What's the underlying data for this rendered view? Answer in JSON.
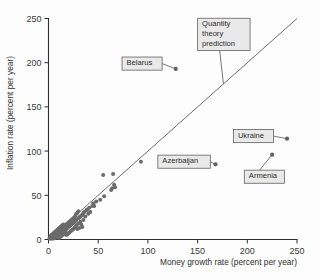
{
  "chart_data": {
    "type": "scatter",
    "title": "",
    "xlabel": "Money growth rate (percent per year)",
    "ylabel": "Inflation rate (percent per year)",
    "xlim": [
      0,
      250
    ],
    "ylim": [
      0,
      250
    ],
    "xticks": [
      0,
      50,
      100,
      150,
      200,
      250
    ],
    "yticks": [
      0,
      50,
      100,
      150,
      200,
      250
    ],
    "xtick_labels": [
      "0",
      "50",
      "100",
      "150",
      "200",
      "250"
    ],
    "ytick_labels": [
      "0",
      "50",
      "100",
      "150",
      "200",
      "250"
    ],
    "grid": false,
    "legend": "none",
    "reference_line": {
      "name": "Quantity theory prediction",
      "description": "45-degree line where inflation equals money growth",
      "slope": 1,
      "intercept": 0,
      "x_from": 0,
      "x_to": 250,
      "y_from": 0,
      "y_to": 250
    },
    "annotations": [
      {
        "label": "Belarus",
        "x": 128,
        "y": 193,
        "box_x": 74,
        "box_y": 199,
        "leader": "right"
      },
      {
        "label": "Quantity theory prediction",
        "x": 176,
        "y": 176,
        "box_x": 150,
        "box_y": 232,
        "leader": "down-right"
      },
      {
        "label": "Ukraine",
        "x": 240,
        "y": 114,
        "box_x": 186,
        "box_y": 117,
        "leader": "right"
      },
      {
        "label": "Armenia",
        "x": 225,
        "y": 96,
        "box_x": 197,
        "box_y": 71,
        "leader": "up"
      },
      {
        "label": "Azerbaijan",
        "x": 168,
        "y": 85,
        "box_x": 110,
        "box_y": 88,
        "leader": "right"
      }
    ],
    "points": [
      {
        "x": 128,
        "y": 193,
        "country": "Belarus"
      },
      {
        "x": 240,
        "y": 114,
        "country": "Ukraine"
      },
      {
        "x": 225,
        "y": 96,
        "country": "Armenia"
      },
      {
        "x": 168,
        "y": 85,
        "country": "Azerbaijan"
      },
      {
        "x": 93,
        "y": 88
      },
      {
        "x": 55,
        "y": 73
      },
      {
        "x": 65,
        "y": 74
      },
      {
        "x": 66,
        "y": 62
      },
      {
        "x": 67,
        "y": 59
      },
      {
        "x": 64,
        "y": 58
      },
      {
        "x": 63,
        "y": 56
      },
      {
        "x": 56,
        "y": 49
      },
      {
        "x": 52,
        "y": 45
      },
      {
        "x": 48,
        "y": 43
      },
      {
        "x": 45,
        "y": 41
      },
      {
        "x": 44,
        "y": 38
      },
      {
        "x": 41,
        "y": 36
      },
      {
        "x": 39,
        "y": 34
      },
      {
        "x": 38,
        "y": 33
      },
      {
        "x": 36,
        "y": 31
      },
      {
        "x": 35,
        "y": 30
      },
      {
        "x": 34,
        "y": 28
      },
      {
        "x": 33,
        "y": 27
      },
      {
        "x": 32,
        "y": 26
      },
      {
        "x": 31,
        "y": 25
      },
      {
        "x": 30,
        "y": 24
      },
      {
        "x": 30,
        "y": 32
      },
      {
        "x": 29,
        "y": 30
      },
      {
        "x": 28,
        "y": 29
      },
      {
        "x": 28,
        "y": 22
      },
      {
        "x": 27,
        "y": 21
      },
      {
        "x": 27,
        "y": 27
      },
      {
        "x": 26,
        "y": 20
      },
      {
        "x": 26,
        "y": 25
      },
      {
        "x": 25,
        "y": 19
      },
      {
        "x": 25,
        "y": 24
      },
      {
        "x": 24,
        "y": 18
      },
      {
        "x": 24,
        "y": 23
      },
      {
        "x": 23,
        "y": 17
      },
      {
        "x": 23,
        "y": 22
      },
      {
        "x": 22,
        "y": 16
      },
      {
        "x": 22,
        "y": 21
      },
      {
        "x": 21,
        "y": 15
      },
      {
        "x": 21,
        "y": 20
      },
      {
        "x": 33,
        "y": 17
      },
      {
        "x": 34,
        "y": 14
      },
      {
        "x": 31,
        "y": 13
      },
      {
        "x": 29,
        "y": 12
      },
      {
        "x": 20,
        "y": 14
      },
      {
        "x": 20,
        "y": 19
      },
      {
        "x": 19,
        "y": 13
      },
      {
        "x": 19,
        "y": 18
      },
      {
        "x": 18,
        "y": 12
      },
      {
        "x": 18,
        "y": 17
      },
      {
        "x": 17,
        "y": 11
      },
      {
        "x": 17,
        "y": 16
      },
      {
        "x": 16,
        "y": 10
      },
      {
        "x": 16,
        "y": 15
      },
      {
        "x": 15,
        "y": 9
      },
      {
        "x": 15,
        "y": 14
      },
      {
        "x": 14,
        "y": 8
      },
      {
        "x": 14,
        "y": 13
      },
      {
        "x": 13,
        "y": 7
      },
      {
        "x": 13,
        "y": 12
      },
      {
        "x": 12,
        "y": 6
      },
      {
        "x": 12,
        "y": 11
      },
      {
        "x": 11,
        "y": 5
      },
      {
        "x": 11,
        "y": 10
      },
      {
        "x": 10,
        "y": 4
      },
      {
        "x": 10,
        "y": 9
      },
      {
        "x": 9,
        "y": 3
      },
      {
        "x": 9,
        "y": 8
      },
      {
        "x": 8,
        "y": 3
      },
      {
        "x": 8,
        "y": 7
      },
      {
        "x": 7,
        "y": 2
      },
      {
        "x": 7,
        "y": 6
      },
      {
        "x": 6,
        "y": 2
      },
      {
        "x": 6,
        "y": 5
      },
      {
        "x": 5,
        "y": 1
      },
      {
        "x": 5,
        "y": 4
      },
      {
        "x": 4,
        "y": 1
      },
      {
        "x": 4,
        "y": 3
      },
      {
        "x": 3,
        "y": 1
      },
      {
        "x": 3,
        "y": 2
      },
      {
        "x": 2,
        "y": 1
      },
      {
        "x": 2,
        "y": 2
      },
      {
        "x": 1,
        "y": 1
      },
      {
        "x": 12,
        "y": 3
      },
      {
        "x": 13,
        "y": 4
      },
      {
        "x": 14,
        "y": 5
      },
      {
        "x": 15,
        "y": 6
      },
      {
        "x": 16,
        "y": 7
      },
      {
        "x": 17,
        "y": 8
      },
      {
        "x": 11,
        "y": 2
      },
      {
        "x": 10,
        "y": 2
      },
      {
        "x": 9,
        "y": 5
      },
      {
        "x": 8,
        "y": 4
      },
      {
        "x": 7,
        "y": 9
      },
      {
        "x": 6,
        "y": 8
      },
      {
        "x": 18,
        "y": 5
      },
      {
        "x": 19,
        "y": 6
      },
      {
        "x": 20,
        "y": 7
      },
      {
        "x": 21,
        "y": 8
      },
      {
        "x": 22,
        "y": 9
      },
      {
        "x": 23,
        "y": 10
      },
      {
        "x": 24,
        "y": 11
      },
      {
        "x": 25,
        "y": 12
      },
      {
        "x": 26,
        "y": 13
      },
      {
        "x": 27,
        "y": 14
      },
      {
        "x": 5,
        "y": 7
      },
      {
        "x": 4,
        "y": 6
      },
      {
        "x": 3,
        "y": 5
      },
      {
        "x": 2,
        "y": 4
      },
      {
        "x": 14,
        "y": 16
      },
      {
        "x": 15,
        "y": 17
      },
      {
        "x": 13,
        "y": 15
      },
      {
        "x": 12,
        "y": 14
      },
      {
        "x": 11,
        "y": 13
      },
      {
        "x": 10,
        "y": 12
      },
      {
        "x": 9,
        "y": 11
      },
      {
        "x": 8,
        "y": 10
      },
      {
        "x": 28,
        "y": 16
      },
      {
        "x": 30,
        "y": 18
      },
      {
        "x": 32,
        "y": 20
      },
      {
        "x": 35,
        "y": 22
      },
      {
        "x": 37,
        "y": 26
      },
      {
        "x": 40,
        "y": 29
      },
      {
        "x": 42,
        "y": 31
      },
      {
        "x": 46,
        "y": 38
      }
    ]
  }
}
